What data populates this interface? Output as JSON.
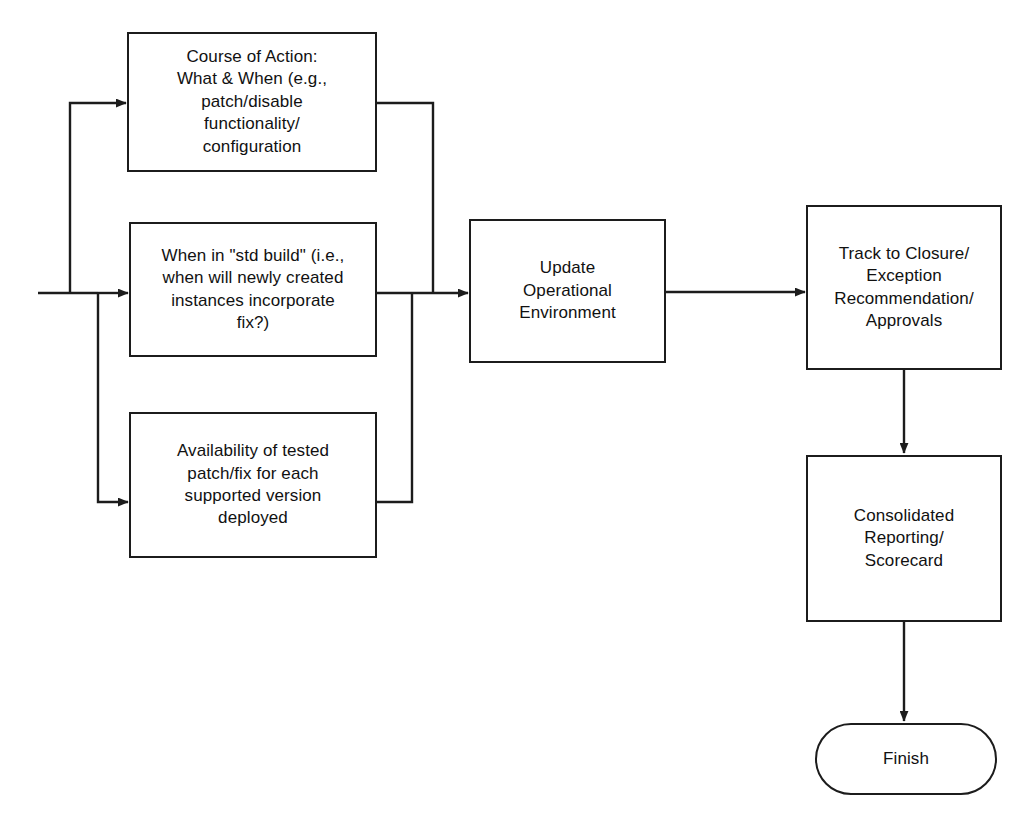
{
  "diagram": {
    "type": "flowchart",
    "background_color": "#ffffff",
    "line_color": "#1c1c1c",
    "text_color": "#111111",
    "nodes": [
      {
        "id": "course-of-action",
        "shape": "rectangle",
        "label": "Course of Action:\nWhat & When (e.g.,\npatch/disable\nfunctionality/\nconfiguration"
      },
      {
        "id": "std-build",
        "shape": "rectangle",
        "label": "When in \"std build\" (i.e.,\nwhen will newly created\ninstances incorporate\nfix?)"
      },
      {
        "id": "availability-tested-patch",
        "shape": "rectangle",
        "label": "Availability of tested\npatch/fix for each\nsupported version\ndeployed"
      },
      {
        "id": "update-operational-environment",
        "shape": "rectangle",
        "label": "Update\nOperational\nEnvironment"
      },
      {
        "id": "track-to-closure",
        "shape": "rectangle",
        "label": "Track to Closure/\nException\nRecommendation/\nApprovals"
      },
      {
        "id": "consolidated-reporting",
        "shape": "rectangle",
        "label": "Consolidated\nReporting/\nScorecard"
      },
      {
        "id": "finish",
        "shape": "terminator",
        "label": "Finish"
      }
    ],
    "edges": [
      {
        "from": "incoming-left",
        "to": "course-of-action",
        "style": "orthogonal-arrow"
      },
      {
        "from": "incoming-left",
        "to": "std-build",
        "style": "orthogonal-arrow"
      },
      {
        "from": "incoming-left",
        "to": "availability-tested-patch",
        "style": "orthogonal-arrow"
      },
      {
        "from": "course-of-action",
        "to": "update-operational-environment",
        "style": "orthogonal-arrow"
      },
      {
        "from": "std-build",
        "to": "update-operational-environment",
        "style": "straight-arrow"
      },
      {
        "from": "availability-tested-patch",
        "to": "update-operational-environment",
        "style": "orthogonal-arrow"
      },
      {
        "from": "update-operational-environment",
        "to": "track-to-closure",
        "style": "straight-arrow"
      },
      {
        "from": "track-to-closure",
        "to": "consolidated-reporting",
        "style": "straight-arrow-down"
      },
      {
        "from": "consolidated-reporting",
        "to": "finish",
        "style": "straight-arrow-down"
      }
    ]
  }
}
